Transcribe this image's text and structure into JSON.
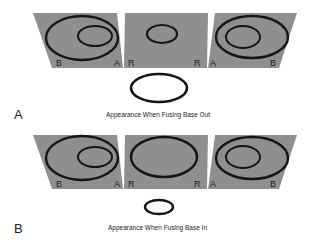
{
  "figure": {
    "colors": {
      "panel": "#8f8f8f",
      "ring": "#151515",
      "background": "#ffffff"
    },
    "parts": [
      {
        "label": "A",
        "caption": "Appearance When Fusing Base Out",
        "panels": [
          {
            "position": "left",
            "corner_labels": [
              "B",
              "A"
            ],
            "content": "large ring with smaller inner ring offset right"
          },
          {
            "position": "middle",
            "corner_labels": [
              "R",
              "R"
            ],
            "content": "single small ring"
          },
          {
            "position": "right",
            "corner_labels": [
              "A",
              "B"
            ],
            "content": "large ring with smaller inner ring offset left"
          }
        ],
        "fused_result": "large ring"
      },
      {
        "label": "B",
        "caption": "Appearance When Fusing Base In",
        "panels": [
          {
            "position": "left",
            "corner_labels": [
              "B",
              "A"
            ],
            "content": "large ring with smaller inner ring offset right"
          },
          {
            "position": "middle",
            "corner_labels": [
              "R",
              "R"
            ],
            "content": "single large ring"
          },
          {
            "position": "right",
            "corner_labels": [
              "A",
              "B"
            ],
            "content": "large ring with smaller inner ring offset left"
          }
        ],
        "fused_result": "small ring"
      }
    ]
  }
}
